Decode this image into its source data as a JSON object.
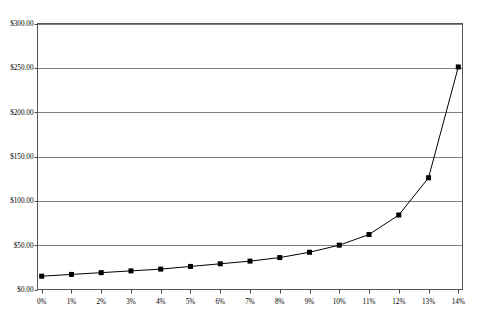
{
  "chart_data": {
    "type": "line",
    "title": "",
    "subtitle": "",
    "xlabel": "",
    "ylabel": "",
    "categories": [
      "0%",
      "1%",
      "2%",
      "3%",
      "4%",
      "5%",
      "6%",
      "7%",
      "8%",
      "9%",
      "10%",
      "11%",
      "12%",
      "13%",
      "14%"
    ],
    "x": [
      0,
      1,
      2,
      3,
      4,
      5,
      6,
      7,
      8,
      9,
      10,
      11,
      12,
      13,
      14
    ],
    "values": [
      15,
      17,
      19,
      21,
      23,
      26,
      29,
      32,
      36,
      42,
      50,
      62,
      84,
      126,
      251
    ],
    "series": [
      {
        "name": "",
        "values": [
          15,
          17,
          19,
          21,
          23,
          26,
          29,
          32,
          36,
          42,
          50,
          62,
          84,
          126,
          251
        ],
        "color": "#000000",
        "marker": "square"
      }
    ],
    "ylim": [
      0,
      300
    ],
    "xlim": [
      -0.5,
      14.5
    ],
    "ytick_labels": [
      "$0.00",
      "$50.00",
      "$100.00",
      "$150.00",
      "$200.00",
      "$250.00",
      "$300.00"
    ],
    "ytick_values": [
      0,
      50,
      100,
      150,
      200,
      250,
      300
    ],
    "xtick_labels": [
      "0%",
      "1%",
      "2%",
      "3%",
      "4%",
      "5%",
      "6%",
      "7%",
      "8%",
      "9%",
      "10%",
      "11%",
      "12%",
      "13%",
      "14%"
    ],
    "grid": "horizontal",
    "legend": "none",
    "legend_position": "none",
    "plot_border": true,
    "colors": {
      "line": "#000000",
      "marker": "#000000",
      "grid": "#808080",
      "axis": "#4d4d4d",
      "background": "#ffffff"
    }
  }
}
